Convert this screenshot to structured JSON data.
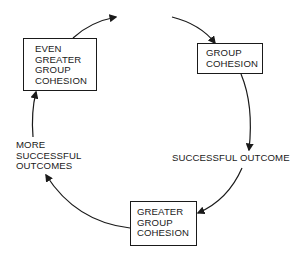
{
  "diagram": {
    "type": "cycle",
    "nodes": {
      "even_greater_group_cohesion": {
        "lines": [
          "EVEN",
          "GREATER",
          "GROUP",
          "COHESION"
        ],
        "boxed": true
      },
      "group_cohesion": {
        "lines": [
          "GROUP",
          "COHESION"
        ],
        "boxed": true
      },
      "successful_outcome": {
        "lines": [
          "SUCCESSFUL OUTCOME"
        ],
        "boxed": false
      },
      "greater_group_cohesion": {
        "lines": [
          "GREATER",
          "GROUP",
          "COHESION"
        ],
        "boxed": true
      },
      "more_successful_outcomes": {
        "lines": [
          "MORE",
          "SUCCESSFUL",
          "OUTCOMES"
        ],
        "boxed": false
      }
    },
    "edges": [
      {
        "from": "even_greater_group_cohesion",
        "to": "group_cohesion",
        "note": "broken arc across top, continues cycle"
      },
      {
        "from": "group_cohesion",
        "to": "successful_outcome"
      },
      {
        "from": "successful_outcome",
        "to": "greater_group_cohesion"
      },
      {
        "from": "greater_group_cohesion",
        "to": "more_successful_outcomes"
      },
      {
        "from": "more_successful_outcomes",
        "to": "even_greater_group_cohesion"
      }
    ],
    "colors": {
      "stroke": "#1a1a1a",
      "background": "#ffffff"
    }
  }
}
